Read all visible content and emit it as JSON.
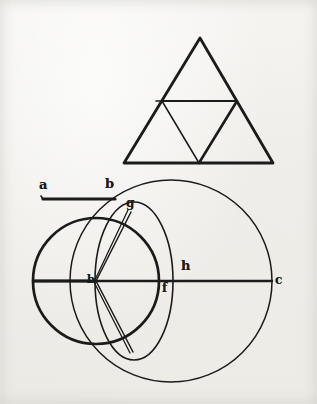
{
  "document": {
    "kind": "scanned-geometric-diagram",
    "paper_color": "#f2f1ee",
    "ink_color": "#1b1b1b",
    "border_color": "#ffffff"
  },
  "figures": {
    "triangle": {
      "name": "subdivided-equilateral-triangle",
      "apex": {
        "x": 200,
        "y": 38
      },
      "base_left": {
        "x": 124,
        "y": 163
      },
      "base_right": {
        "x": 273,
        "y": 163
      },
      "midpoint_left": {
        "x": 162,
        "y": 101
      },
      "midpoint_right": {
        "x": 237,
        "y": 101
      },
      "midpoint_base": {
        "x": 199,
        "y": 163
      },
      "stroke_width_outer": 2.6,
      "stroke_width_inner": 1.6
    },
    "segment_ab": {
      "name": "line-segment-a-b",
      "x1": 43,
      "y1": 199,
      "x2": 115,
      "y2": 199,
      "stroke_width": 3.0
    },
    "left_circle": {
      "name": "left-circle",
      "cx": 96,
      "cy": 281,
      "r": 63,
      "stroke_width": 2.6
    },
    "right_circle": {
      "name": "right-circle",
      "cx": 171,
      "cy": 281,
      "r": 101,
      "stroke_width": 1.5
    },
    "middle_ellipse": {
      "name": "middle-ellipse",
      "cx": 134,
      "cy": 281,
      "rx": 39,
      "ry": 79,
      "stroke_width": 1.5
    },
    "horizontal_axis": {
      "name": "horizontal-diameter-line",
      "x1": 33,
      "y1": 281,
      "x2": 272,
      "y2": 281,
      "stroke_width": 2.2
    },
    "chords": {
      "name": "chords-through-b",
      "upper": {
        "x1": 131,
        "y1": 212,
        "x2": 96,
        "y2": 281
      },
      "lower": {
        "x1": 96,
        "y1": 281,
        "x2": 133,
        "y2": 352
      },
      "upper_outer": {
        "x1": 128,
        "y1": 211,
        "x2": 94,
        "y2": 282
      },
      "lower_outer": {
        "x1": 94,
        "y1": 282,
        "x2": 130,
        "y2": 353
      },
      "stroke_width": 1.4
    }
  },
  "labels": {
    "a": {
      "text": "a",
      "x": 39,
      "y": 181,
      "size": 13
    },
    "b_top": {
      "text": "b",
      "x": 105,
      "y": 180,
      "size": 13
    },
    "g": {
      "text": "g",
      "x": 126,
      "y": 199,
      "size": 12
    },
    "b_center": {
      "text": "b",
      "x": 86,
      "y": 275,
      "size": 12
    },
    "h": {
      "text": "h",
      "x": 181,
      "y": 260,
      "size": 13
    },
    "f": {
      "text": "f",
      "x": 161,
      "y": 284,
      "size": 12
    },
    "c": {
      "text": "c",
      "x": 275,
      "y": 275,
      "size": 12
    }
  }
}
